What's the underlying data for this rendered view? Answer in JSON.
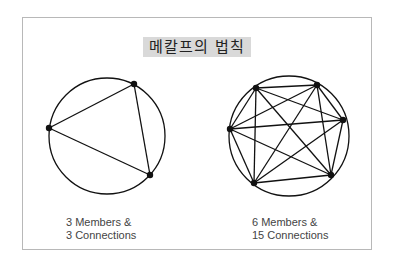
{
  "title": "메칼프의 법칙",
  "diagrams": [
    {
      "members": 3,
      "connections": 3,
      "caption_line1": "3 Members &",
      "caption_line2": "3 Connections",
      "circle": {
        "cx": 107,
        "cy": 136,
        "r": 58
      },
      "nodes": [
        [
          134,
          84
        ],
        [
          49,
          128
        ],
        [
          150,
          175
        ]
      ]
    },
    {
      "members": 6,
      "connections": 15,
      "caption_line1": "6 Members &",
      "caption_line2": "15 Connections",
      "circle": {
        "cx": 289,
        "cy": 136,
        "r": 60
      },
      "nodes": [
        [
          256,
          88
        ],
        [
          317,
          85
        ],
        [
          343,
          120
        ],
        [
          331,
          175
        ],
        [
          254,
          183
        ],
        [
          230,
          129
        ]
      ]
    }
  ],
  "colors": {
    "line": "#111111",
    "title_bg": "#d9d9d9",
    "frame": "#b8b8b8"
  }
}
